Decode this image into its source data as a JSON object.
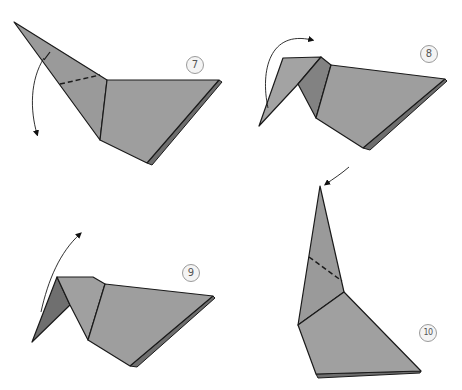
{
  "diagram": {
    "type": "origami-instructions",
    "colors": {
      "paper": "#9a9a9a",
      "paper_dark": "#7d7d7d",
      "paper_light": "#a9a9a9",
      "edge": "#1a1a1a",
      "badge_border": "#9a9a9a",
      "badge_text": "#555555"
    },
    "steps": [
      {
        "number": "7",
        "instruction_icon": "curved-arrow-down",
        "fold_line": "valley-fold-dashed"
      },
      {
        "number": "8",
        "instruction_icon": "curved-arrow-over",
        "fold_line": "none"
      },
      {
        "number": "9",
        "instruction_icon": "curved-arrow-up",
        "fold_line": "none"
      },
      {
        "number": "10",
        "instruction_icon": "straight-arrow-to-tip",
        "fold_line": "valley-fold-dashed"
      }
    ]
  }
}
